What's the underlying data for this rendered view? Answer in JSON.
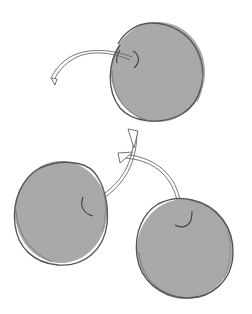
{
  "illustration": {
    "width": 252,
    "height": 314,
    "background": "#ffffff",
    "fill_color": "#a8a8a8",
    "outline_color": "#555555",
    "stem_color": "#666666",
    "cherries": [
      {
        "name": "top-cherry",
        "cx": 157,
        "cy": 72,
        "r": 48
      },
      {
        "name": "bottom-left-cherry",
        "cx": 61,
        "cy": 212,
        "r": 47
      },
      {
        "name": "bottom-right-cherry",
        "cx": 184,
        "cy": 248,
        "r": 49
      }
    ]
  }
}
